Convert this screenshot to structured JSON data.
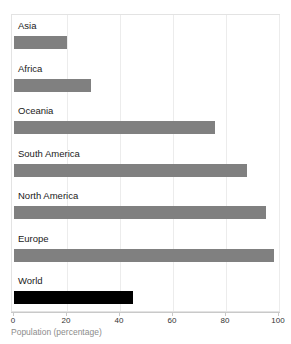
{
  "chart_data": {
    "type": "bar",
    "orientation": "horizontal",
    "title": "",
    "categories": [
      "Asia",
      "Africa",
      "Oceania",
      "South America",
      "North America",
      "Europe",
      "World"
    ],
    "values": [
      20,
      29,
      76,
      88,
      95,
      98,
      45
    ],
    "xlabel": "Population (percentage)",
    "ylabel": "",
    "xlim": [
      0,
      100
    ],
    "xticks": [
      0,
      20,
      40,
      60,
      80,
      100
    ],
    "xtick_labels": [
      "0",
      "20",
      "40",
      "60",
      "80",
      "100"
    ],
    "grid": "vertical",
    "legend": "none",
    "bar_colors": [
      "#808080",
      "#808080",
      "#808080",
      "#808080",
      "#808080",
      "#808080",
      "#000000"
    ],
    "highlight_category": "World",
    "series": [
      {
        "name": "Population (percentage)",
        "points": [
          {
            "category": "Asia",
            "value": 20,
            "color": "#808080"
          },
          {
            "category": "Africa",
            "value": 29,
            "color": "#808080"
          },
          {
            "category": "Oceania",
            "value": 76,
            "color": "#808080"
          },
          {
            "category": "South America",
            "value": 88,
            "color": "#808080"
          },
          {
            "category": "North America",
            "value": 95,
            "color": "#808080"
          },
          {
            "category": "Europe",
            "value": 98,
            "color": "#808080"
          },
          {
            "category": "World",
            "value": 45,
            "color": "#000000"
          }
        ]
      }
    ]
  },
  "style": {
    "background": "#ffffff",
    "grid_color": "#ececec",
    "frame_color": "#e3e3e3",
    "axis_color": "#c9c9c9",
    "label_color": "#1a1a1a",
    "axis_title_color": "#8c8c8c",
    "bar_color": "#808080",
    "highlight_color": "#000000"
  }
}
